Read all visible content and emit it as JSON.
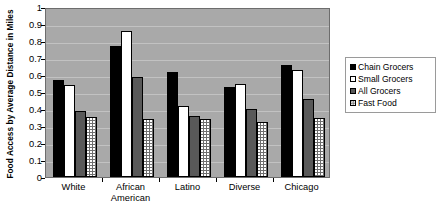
{
  "chart_data": {
    "type": "bar",
    "title": "",
    "subtitle": "",
    "xlabel": "",
    "ylabel": "Food Access by Average Distance in Miles",
    "ylim": [
      0,
      1
    ],
    "ytick_step": 0.1,
    "grid": true,
    "legend_position": "right",
    "categories": [
      "White",
      "African American",
      "Latino",
      "Diverse",
      "Chicago"
    ],
    "category_lines": [
      [
        "White"
      ],
      [
        "African",
        "American"
      ],
      [
        "Latino"
      ],
      [
        "Diverse"
      ],
      [
        "Chicago"
      ]
    ],
    "ytick_labels": [
      "1",
      "0.9",
      "0.8",
      "0.7",
      "0.6",
      "0.5",
      "0.4",
      "0.3",
      "0.2",
      "0.1",
      "0"
    ],
    "ytick_values": [
      1,
      0.9,
      0.8,
      0.7,
      0.6,
      0.5,
      0.4,
      0.3,
      0.2,
      0.1,
      0
    ],
    "series": [
      {
        "name": "Chain Grocers",
        "key": "chain",
        "fill": "#000000",
        "pattern": "solid",
        "values": [
          0.57,
          0.77,
          0.62,
          0.53,
          0.66
        ]
      },
      {
        "name": "Small Grocers",
        "key": "small",
        "fill": "#ffffff",
        "pattern": "solid",
        "values": [
          0.54,
          0.86,
          0.42,
          0.55,
          0.63
        ]
      },
      {
        "name": "All Grocers",
        "key": "all",
        "fill": "#595959",
        "pattern": "solid",
        "values": [
          0.39,
          0.59,
          0.36,
          0.4,
          0.46
        ]
      },
      {
        "name": "Fast Food",
        "key": "fast",
        "fill": "#6f6f6f",
        "pattern": "dotted",
        "values": [
          0.355,
          0.34,
          0.34,
          0.325,
          0.35
        ]
      }
    ]
  },
  "legend": {
    "items": [
      {
        "label": "Chain Grocers",
        "key": "chain"
      },
      {
        "label": "Small Grocers",
        "key": "small"
      },
      {
        "label": "All Grocers",
        "key": "all"
      },
      {
        "label": "Fast Food",
        "key": "fast"
      }
    ]
  },
  "plot": {
    "background": "#a9a9a9",
    "gridline_color": "#c2c2c2",
    "border_color": "#6d6d6d"
  }
}
